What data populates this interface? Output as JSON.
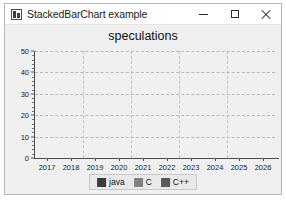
{
  "window": {
    "title": "StackedBarChart example",
    "icon": "app-chart-icon",
    "controls": {
      "minimize": "minimize-icon",
      "maximize": "maximize-icon",
      "close": "close-icon"
    }
  },
  "chart_data": {
    "type": "bar",
    "stacked": true,
    "title": "speculations",
    "xlabel": "",
    "ylabel": "",
    "ylim": [
      0,
      50
    ],
    "yticks": [
      0,
      10,
      20,
      30,
      40,
      50
    ],
    "grid": true,
    "legend_position": "bottom",
    "categories": [
      "2017",
      "2018",
      "2019",
      "2020",
      "2021",
      "2022",
      "2023",
      "2024",
      "2025",
      "2026"
    ],
    "series": [
      {
        "name": "java",
        "color": "#3c3c3c",
        "values": [
          18,
          20,
          20,
          21,
          25,
          29,
          32,
          34,
          34,
          38
        ]
      },
      {
        "name": "C",
        "color": "#808080",
        "values": [
          9,
          12,
          13,
          12,
          13,
          9,
          8,
          9,
          10,
          7
        ]
      },
      {
        "name": "C++",
        "color": "#595959",
        "values": [
          0,
          0,
          0,
          0,
          0,
          0,
          0,
          0,
          0,
          0
        ]
      }
    ],
    "totals": [
      27,
      32,
      33,
      33,
      38,
      38,
      40,
      43,
      44,
      45
    ]
  },
  "colors": {
    "chart_background": "#f0f0f0",
    "plot_background": "#f0f0f0",
    "grid": "#b9b9b9",
    "axis": "#4d4d4d",
    "legend_background": "#e9e9e9"
  }
}
